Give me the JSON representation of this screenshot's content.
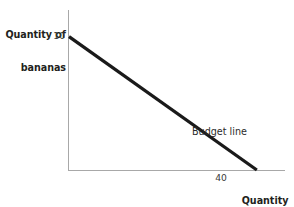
{
  "chart_data": {
    "type": "line",
    "title": "",
    "subtitle": "",
    "xlabel": "Quantity of apples",
    "ylabel": "Quantity of bananas",
    "xlim": [
      0,
      46
    ],
    "ylim": [
      0,
      12
    ],
    "grid": false,
    "legend_position": "none",
    "x_tick_labels": [
      "40"
    ],
    "x_ticks": [
      40
    ],
    "y_tick_labels": [
      "10"
    ],
    "y_ticks": [
      10
    ],
    "series": [
      {
        "name": "Budget line",
        "x": [
          0,
          40
        ],
        "values": [
          10,
          0
        ],
        "color": "#1a1a1a",
        "linewidth": 3
      }
    ],
    "annotations": [
      {
        "text": "Budget line",
        "x": 21.5,
        "y": 3.2
      }
    ]
  },
  "axes": {
    "y_title_line1": "Quantity of",
    "y_title_line2": "bananas",
    "y_tick_10": "10",
    "x_title_line1": "Quantity",
    "x_title_line2": "of apples",
    "x_tick_40": "40",
    "axis_color": "#a8a8a8"
  },
  "annotations": {
    "budget_line": "Budget line"
  },
  "colors": {
    "line": "#1a1a1a",
    "text": "#231f20",
    "axis": "#a8a8a8",
    "background": "#ffffff"
  }
}
